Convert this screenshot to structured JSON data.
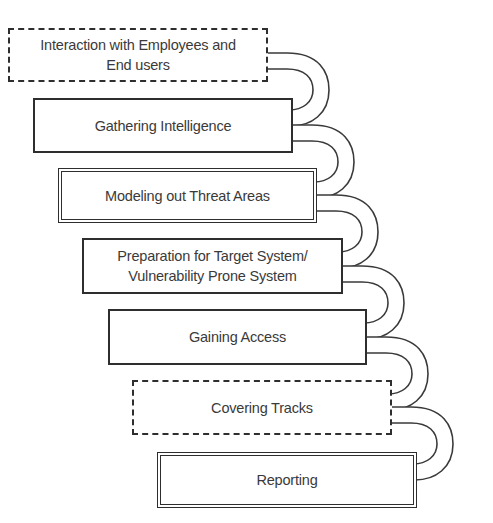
{
  "diagram": {
    "type": "process-flow",
    "steps": [
      {
        "label": "Interaction with Employees and\nEnd users",
        "border": "dashed"
      },
      {
        "label": "Gathering Intelligence",
        "border": "solid"
      },
      {
        "label": "Modeling out Threat Areas",
        "border": "double"
      },
      {
        "label": "Preparation for Target System/\nVulnerability Prone System",
        "border": "solid"
      },
      {
        "label": "Gaining Access",
        "border": "solid"
      },
      {
        "label": "Covering Tracks",
        "border": "dashed"
      },
      {
        "label": "Reporting",
        "border": "double"
      }
    ],
    "connector": "curved-hollow-arrow",
    "colors": {
      "stroke": "#2e2e2e",
      "text": "#3a3a3a",
      "background": "#ffffff"
    }
  }
}
